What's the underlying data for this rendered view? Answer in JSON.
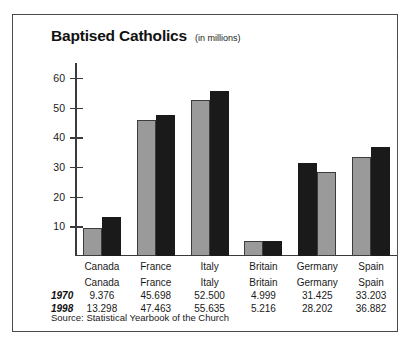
{
  "chart_data": {
    "type": "bar",
    "title": "Baptised Catholics",
    "subtitle": "(in millions)",
    "xlabel": "",
    "ylabel": "",
    "ylim": [
      0,
      65
    ],
    "yticks": [
      10,
      20,
      30,
      40,
      50,
      60
    ],
    "ytick_labels": [
      "10",
      "20",
      "30",
      "40",
      "50",
      "60"
    ],
    "grid": false,
    "legend": "none",
    "categories": [
      "Canada",
      "France",
      "Italy",
      "Britain",
      "Germany",
      "Spain"
    ],
    "series": [
      {
        "name": "1970",
        "color": "#9a9a9a",
        "values": [
          9.376,
          45.698,
          52.5,
          4.999,
          31.425,
          33.203
        ],
        "labels": [
          "9.376",
          "45.698",
          "52.500",
          "4.999",
          "31.425",
          "33.203"
        ]
      },
      {
        "name": "1998",
        "color": "#1a1a1a",
        "values": [
          13.298,
          47.463,
          55.635,
          5.216,
          28.202,
          36.882
        ],
        "labels": [
          "13.298",
          "47.463",
          "55.635",
          "5.216",
          "28.202",
          "36.882"
        ]
      }
    ],
    "source": "Source: Statistical Yearbook of the Church"
  },
  "table": {
    "row_headers": [
      "1970",
      "1998"
    ],
    "column_headers": [
      "Canada",
      "France",
      "Italy",
      "Britain",
      "Germany",
      "Spain"
    ],
    "rows": [
      [
        "9.376",
        "45.698",
        "52.500",
        "4.999",
        "31.425",
        "33.203"
      ],
      [
        "13.298",
        "47.463",
        "55.635",
        "5.216",
        "28.202",
        "36.882"
      ]
    ]
  },
  "colors": {
    "series_1970": "#9a9a9a",
    "series_1998": "#1a1a1a",
    "border": "#4a4a4a",
    "axis": "#3a3a3a",
    "text": "#1a1a1a",
    "background": "#ffffff"
  }
}
